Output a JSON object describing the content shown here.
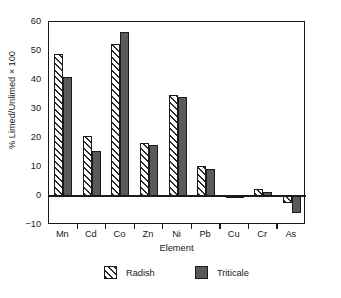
{
  "chart_data": {
    "type": "bar",
    "title": "",
    "subtitle": "",
    "xlabel": "Element",
    "ylabel": "% Limed/Unlimed × 100",
    "categories": [
      "Mn",
      "Cd",
      "Co",
      "Zn",
      "Ni",
      "Pb",
      "Cu",
      "Cr",
      "As"
    ],
    "series": [
      {
        "name": "Radish",
        "fill": "white-diagonal-hatch",
        "color": "#ffffff",
        "values": [
          48.8,
          20.7,
          52.5,
          18.4,
          34.8,
          10.4,
          -0.7,
          2.5,
          -2.3
        ]
      },
      {
        "name": "Triticale",
        "fill": "solid-gray",
        "color": "#5a5a5a",
        "values": [
          41.0,
          15.5,
          56.5,
          17.5,
          34.0,
          9.4,
          -0.6,
          1.3,
          -6.0
        ]
      }
    ],
    "ylim": [
      -10,
      60
    ],
    "ytick_values": [
      60,
      50,
      40,
      30,
      20,
      10,
      0,
      -10
    ],
    "ytick_labels": [
      "60",
      "50",
      "40",
      "30",
      "20",
      "10",
      "0",
      "−10"
    ],
    "grid": false,
    "legend_position": "bottom-center",
    "legend_entries": [
      "Radish",
      "Triticale"
    ],
    "annotations": []
  }
}
